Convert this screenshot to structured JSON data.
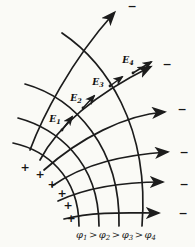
{
  "colors": {
    "ink": "#1c1c1c",
    "paper": "#fafaf6"
  },
  "symbols": {
    "plus": "+",
    "minus": "−"
  },
  "figure": {
    "plus_signs": [
      {
        "x": 25,
        "y": 167
      },
      {
        "x": 40,
        "y": 174
      },
      {
        "x": 52,
        "y": 184
      },
      {
        "x": 62,
        "y": 193
      },
      {
        "x": 68,
        "y": 205
      },
      {
        "x": 71,
        "y": 218
      }
    ],
    "minus_signs": [
      {
        "x": 132,
        "y": 6
      },
      {
        "x": 167,
        "y": 64
      },
      {
        "x": 182,
        "y": 109
      },
      {
        "x": 184,
        "y": 152
      },
      {
        "x": 184,
        "y": 184
      },
      {
        "x": 183,
        "y": 213
      }
    ],
    "e_vectors": [
      {
        "base": "E",
        "sub": "1",
        "x1": 62,
        "y1": 130,
        "x2": 72,
        "y2": 117,
        "lx": 55,
        "ly": 122
      },
      {
        "base": "E",
        "sub": "2",
        "x1": 83,
        "y1": 108,
        "x2": 94,
        "y2": 96,
        "lx": 76,
        "ly": 101
      },
      {
        "base": "E",
        "sub": "3",
        "x1": 110,
        "y1": 86,
        "x2": 122,
        "y2": 77,
        "lx": 98,
        "ly": 85
      },
      {
        "base": "E",
        "sub": "4",
        "x1": 133,
        "y1": 73,
        "x2": 151,
        "y2": 62,
        "lx": 128,
        "ly": 63
      }
    ]
  },
  "caption": {
    "phi": "φ",
    "gt": ">",
    "subs": [
      "1",
      "2",
      "3",
      "4"
    ]
  }
}
